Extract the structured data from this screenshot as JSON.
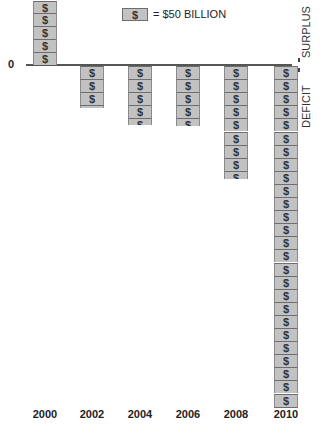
{
  "chart_data": {
    "type": "bar",
    "title": "",
    "legend": {
      "symbol": "$",
      "label": "= $50 BILLION",
      "unit_value": 50
    },
    "categories": [
      "2000",
      "2002",
      "2004",
      "2006",
      "2008",
      "2010"
    ],
    "blocks": [
      4.9,
      3.2,
      4.5,
      4.6,
      8.6,
      26.1
    ],
    "values_billions": [
      245,
      -160,
      -225,
      -230,
      -430,
      -1305
    ],
    "xlabel": "",
    "ylabel_top": "SURPLUS",
    "ylabel_bottom": "DEFICIT",
    "zero_label": "0",
    "grid": false,
    "note": "Pictogram bar chart; each $ block represents $50 billion. 2000 bar cut off at top of image."
  },
  "labels": {
    "zero": "0",
    "surplus": "SURPLUS",
    "deficit": "DEFICIT",
    "legend_symbol": "$",
    "legend_text": "= $50 BILLION",
    "years": [
      "2000",
      "2002",
      "2004",
      "2006",
      "2008",
      "2010"
    ]
  }
}
